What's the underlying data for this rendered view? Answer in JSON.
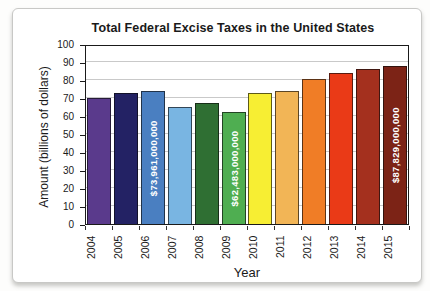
{
  "card": {
    "title": "Total Federal Excise Taxes in the United States"
  },
  "chart_data": {
    "type": "bar",
    "title": "Total Federal Excise Taxes in the United States",
    "xlabel": "Year",
    "ylabel": "Amount (billions of dollars)",
    "ylim": [
      0,
      100
    ],
    "ytick_step": 10,
    "grid": true,
    "legend": "none",
    "categories": [
      "2004",
      "2005",
      "2006",
      "2007",
      "2008",
      "2009",
      "2010",
      "2011",
      "2012",
      "2013",
      "2014",
      "2015"
    ],
    "values": [
      70,
      73,
      73.961,
      65,
      67.5,
      62.483,
      73,
      74,
      80.5,
      84,
      86,
      87.829
    ],
    "bar_labels": [
      "",
      "",
      "$73,961,000,000",
      "",
      "",
      "$62,483,000,000",
      "",
      "",
      "",
      "",
      "",
      "$87,829,000,000"
    ],
    "bar_colors": [
      "#5a3a8c",
      "#232264",
      "#4a7fc1",
      "#79b5e2",
      "#2f6f33",
      "#4fae51",
      "#f7ee33",
      "#f2b556",
      "#f07d26",
      "#ea3a17",
      "#a4301e",
      "#7c2316"
    ],
    "bar_label_color": "#ffffff"
  },
  "colors": {
    "grid": "#c9c9c9",
    "axis": "#1a1a1a",
    "text": "#1a1a1a",
    "card_border": "#c8c8c6",
    "plot_background": "#ffffff"
  }
}
